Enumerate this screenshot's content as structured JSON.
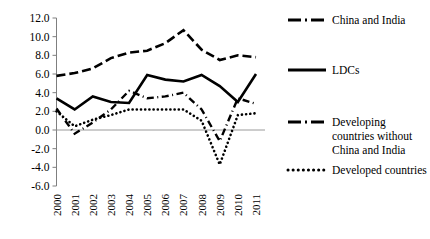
{
  "chart_data": {
    "type": "line",
    "title": "",
    "xlabel": "",
    "ylabel": "",
    "categories": [
      "2000",
      "2001",
      "2002",
      "2003",
      "2004",
      "2005",
      "2006",
      "2007",
      "2008",
      "2009",
      "2010",
      "2011"
    ],
    "ylim": [
      -6.0,
      12.0
    ],
    "ytick_labels": [
      "12.0",
      "10.0",
      "8.0",
      "6.0",
      "4.0",
      "2.0",
      "0.0",
      "-2.0",
      "-4.0",
      "-6.0"
    ],
    "ytick_values": [
      12.0,
      10.0,
      8.0,
      6.0,
      4.0,
      2.0,
      0.0,
      -2.0,
      -4.0,
      -6.0
    ],
    "grid": false,
    "legend_position": "right",
    "series": [
      {
        "name": "China and India",
        "style": "dashed",
        "values": [
          5.8,
          6.1,
          6.6,
          7.7,
          8.3,
          8.5,
          9.3,
          10.7,
          8.6,
          7.5,
          8.0,
          7.8
        ]
      },
      {
        "name": "LDCs",
        "style": "solid",
        "values": [
          3.4,
          2.2,
          3.6,
          3.0,
          2.9,
          5.9,
          5.4,
          5.2,
          5.9,
          4.7,
          3.0,
          6.0
        ]
      },
      {
        "name": "Developing countries without China and India",
        "style": "dash-dot",
        "values": [
          2.3,
          -0.4,
          0.8,
          2.2,
          4.2,
          3.4,
          3.6,
          4.0,
          2.2,
          -1.2,
          3.4,
          2.8
        ]
      },
      {
        "name": "Developed countries",
        "style": "dotted",
        "values": [
          2.0,
          0.4,
          1.1,
          1.6,
          2.2,
          2.2,
          2.2,
          2.2,
          1.0,
          -3.7,
          1.6,
          1.8
        ]
      }
    ]
  },
  "legend": {
    "items": [
      {
        "label": "China and India",
        "style": "dashed"
      },
      {
        "label": "LDCs",
        "style": "solid"
      },
      {
        "label": "Developing",
        "label2": "countries without",
        "label3": "China and India",
        "style": "dash-dot"
      },
      {
        "label": "Developed countries",
        "style": "dotted"
      }
    ]
  },
  "axes": {
    "x_first": "2000",
    "x_last": "2011",
    "y_max": "12.0",
    "y_min": "-6.0"
  }
}
